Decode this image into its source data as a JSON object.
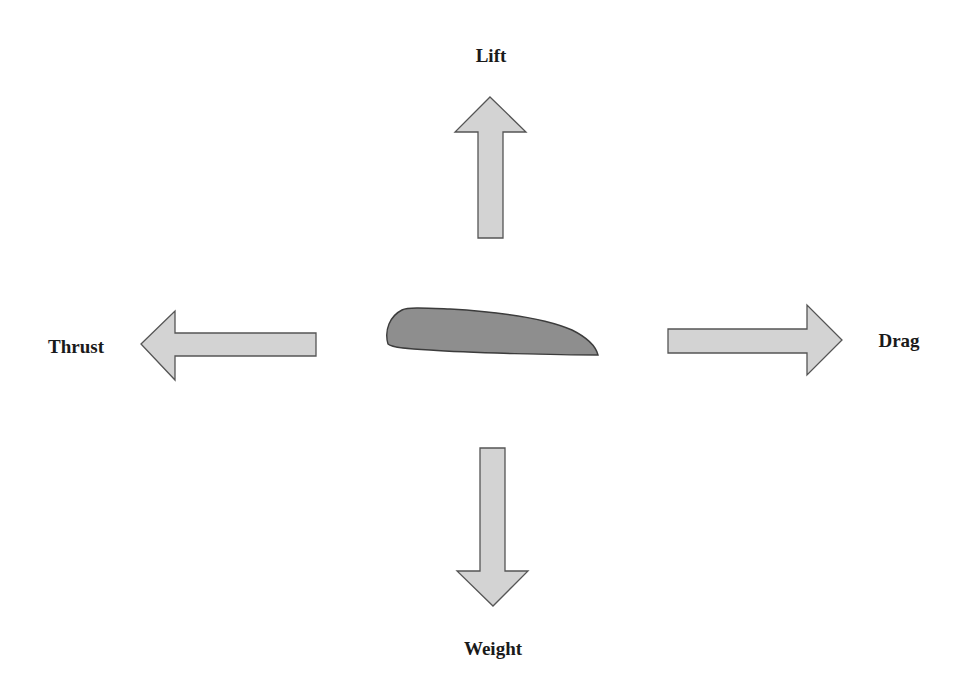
{
  "diagram": {
    "colors": {
      "arrow_fill": "#d3d3d3",
      "arrow_stroke": "#555555",
      "airfoil_fill": "#8e8e8e",
      "airfoil_stroke": "#3c3c3c",
      "label": "#1a1a1a"
    },
    "center_object": {
      "name": "airfoil",
      "shape": "wing cross-section"
    },
    "forces": [
      {
        "id": "lift",
        "label": "Lift",
        "direction": "up"
      },
      {
        "id": "weight",
        "label": "Weight",
        "direction": "down"
      },
      {
        "id": "thrust",
        "label": "Thrust",
        "direction": "left"
      },
      {
        "id": "drag",
        "label": "Drag",
        "direction": "right"
      }
    ]
  }
}
